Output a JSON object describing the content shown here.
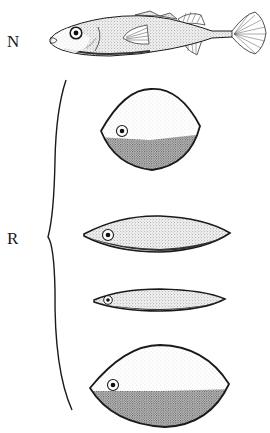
{
  "figure": {
    "labels": {
      "natural": "N",
      "replicas": "R"
    },
    "natural_fish": {
      "description": "stickleback fish drawing"
    },
    "replicas": [
      {
        "shape": "round",
        "description": "round dummy, dark lower half"
      },
      {
        "shape": "elongated",
        "description": "elongated dummy, uniform stipple"
      },
      {
        "shape": "thin",
        "description": "thin dummy, uniform stipple"
      },
      {
        "shape": "oval",
        "description": "large oval dummy, dark lower half"
      }
    ],
    "colors": {
      "ink": "#1a1a1a",
      "stipple_light": "#e9e9e9",
      "stipple_dark": "#9a9a9a",
      "background": "#ffffff"
    }
  }
}
